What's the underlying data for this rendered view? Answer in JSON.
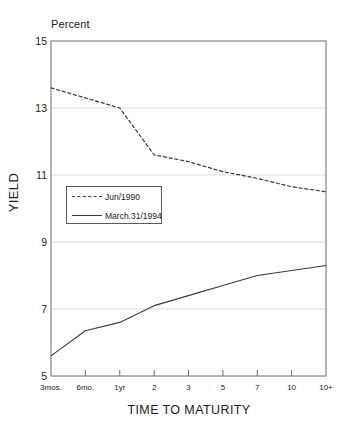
{
  "chart_data": {
    "type": "line",
    "title": "",
    "unit_label": "Percent",
    "xlabel": "TIME TO MATURITY",
    "ylabel": "YIELD",
    "categories": [
      "3mos.",
      "6mo.",
      "1yr",
      "2",
      "3",
      "5",
      "7",
      "10",
      "10+"
    ],
    "yticks": [
      "15",
      "13",
      "11",
      "9",
      "7",
      "5"
    ],
    "ylim": [
      5,
      15
    ],
    "grid": true,
    "legend_position": "inside-left",
    "series": [
      {
        "name": "Jun/1990",
        "style": "dashed",
        "color": "#3a3a3a",
        "values": [
          13.6,
          13.3,
          13.0,
          11.6,
          11.4,
          11.1,
          10.9,
          10.65,
          10.5
        ]
      },
      {
        "name": "March.31/1994",
        "style": "solid",
        "color": "#3a3a3a",
        "values": [
          5.6,
          6.35,
          6.6,
          7.1,
          7.4,
          7.7,
          8.0,
          8.15,
          8.3
        ]
      }
    ]
  }
}
